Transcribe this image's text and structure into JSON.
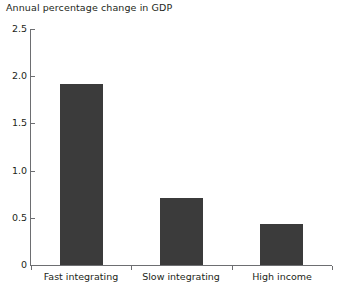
{
  "chart_data": {
    "type": "bar",
    "title": "Annual percentage change in GDP",
    "subtitle": "",
    "xlabel": "",
    "ylabel": "",
    "categories": [
      "Fast integrating",
      "Slow integrating",
      "High income"
    ],
    "values": [
      1.92,
      0.71,
      0.43
    ],
    "series": [
      {
        "name": "Annual percentage change in GDP",
        "values": [
          1.92,
          0.71,
          0.43
        ]
      }
    ],
    "ylim": [
      0,
      2.5
    ],
    "ytick_values": [
      0,
      0.5,
      1.0,
      1.5,
      2.0,
      2.5
    ],
    "ytick_labels": [
      "0",
      "0.5",
      "1.0",
      "1.5",
      "2.0",
      "2.5"
    ],
    "grid": false,
    "legend": false,
    "legend_position": "none",
    "bar_color": "#3b3b3b",
    "axis_color": "#6d6e71",
    "background_color": "#ffffff",
    "text_color": "#231f20"
  }
}
